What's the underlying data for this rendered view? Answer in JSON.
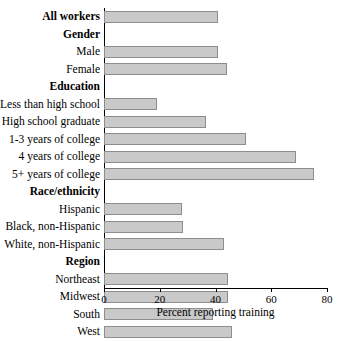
{
  "chart_data": {
    "type": "bar",
    "orientation": "horizontal",
    "title": "",
    "xlabel": "Percent reporting training",
    "ylabel": "",
    "xlim": [
      0,
      80
    ],
    "xticks": [
      0,
      20,
      40,
      60,
      80
    ],
    "grid": false,
    "legend": null,
    "bar_color": "#c9c9c9",
    "bar_border_color": "#8d8d8d",
    "rows": [
      {
        "label": "All workers",
        "type": "group_with_bar",
        "value": 41
      },
      {
        "label": "Gender",
        "type": "group_header",
        "value": null
      },
      {
        "label": "Male",
        "type": "item",
        "value": 41
      },
      {
        "label": "Female",
        "type": "item",
        "value": 44
      },
      {
        "label": "Education",
        "type": "group_header",
        "value": null
      },
      {
        "label": "Less than high school",
        "type": "item",
        "value": 19
      },
      {
        "label": "High school graduate",
        "type": "item",
        "value": 36.5
      },
      {
        "label": "1-3 years of college",
        "type": "item",
        "value": 51
      },
      {
        "label": "4 years of college",
        "type": "item",
        "value": 69
      },
      {
        "label": "5+ years of college",
        "type": "item",
        "value": 75.5
      },
      {
        "label": "Race/ethnicity",
        "type": "group_header",
        "value": null
      },
      {
        "label": "Hispanic",
        "type": "item",
        "value": 28
      },
      {
        "label": "Black, non-Hispanic",
        "type": "item",
        "value": 28.5
      },
      {
        "label": "White, non-Hispanic",
        "type": "item",
        "value": 43
      },
      {
        "label": "Region",
        "type": "group_header",
        "value": null
      },
      {
        "label": "Northeast",
        "type": "item",
        "value": 44.5
      },
      {
        "label": "Midwest",
        "type": "item",
        "value": 44.5
      },
      {
        "label": "South",
        "type": "item",
        "value": 39
      },
      {
        "label": "West",
        "type": "item",
        "value": 46
      }
    ]
  }
}
